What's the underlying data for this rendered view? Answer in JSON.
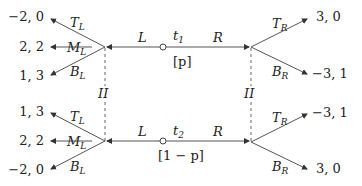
{
  "diagram": {
    "type": "extensive-form game tree",
    "chance_nodes": [
      {
        "label": "t",
        "sub": "1",
        "prob": "[p]"
      },
      {
        "label": "t",
        "sub": "2",
        "prob": "[1 − p]"
      }
    ],
    "info_set_label": "II",
    "top": {
      "left_move": "L",
      "right_move": "R",
      "left_branches": [
        {
          "label": "T",
          "sub": "L",
          "payoff": "−2, 0"
        },
        {
          "label": "M",
          "sub": "L",
          "payoff": "2, 2"
        },
        {
          "label": "B",
          "sub": "L",
          "payoff": "1, 3"
        }
      ],
      "right_branches": [
        {
          "label": "T",
          "sub": "R",
          "payoff": "3, 0"
        },
        {
          "label": "B",
          "sub": "R",
          "payoff": "−3, 1"
        }
      ]
    },
    "bottom": {
      "left_move": "L",
      "right_move": "R",
      "left_branches": [
        {
          "label": "T",
          "sub": "L",
          "payoff": "1, 3"
        },
        {
          "label": "M",
          "sub": "L",
          "payoff": "2, 2"
        },
        {
          "label": "B",
          "sub": "L",
          "payoff": "−2, 0"
        }
      ],
      "right_branches": [
        {
          "label": "T",
          "sub": "R",
          "payoff": "−3, 1"
        },
        {
          "label": "B",
          "sub": "R",
          "payoff": "3, 0"
        }
      ]
    },
    "colors": {
      "line": "#555555",
      "text": "#222222",
      "background": "#ffffff"
    }
  }
}
